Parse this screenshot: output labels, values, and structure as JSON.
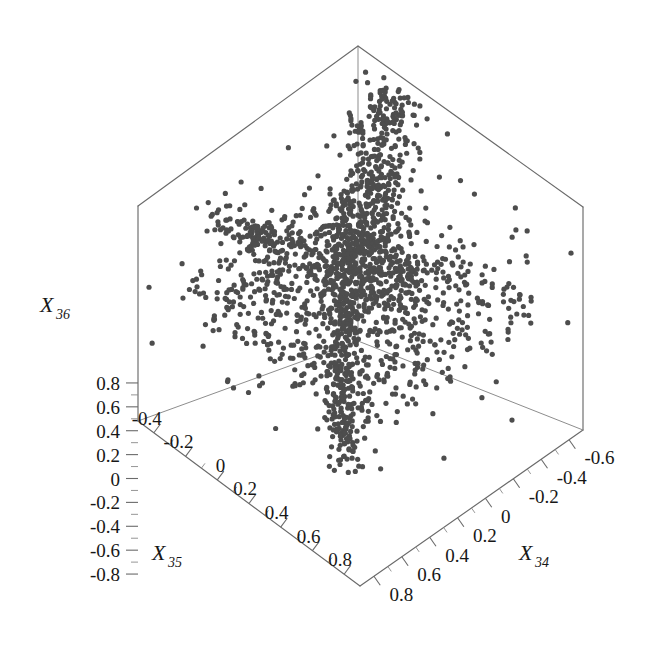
{
  "chart_data": {
    "type": "scatter",
    "projection": "3d",
    "title": "",
    "xlabel": "X_34",
    "ylabel": "X_35",
    "zlabel": "X_36",
    "axes": {
      "x34": {
        "label": "X34",
        "label_base": "X",
        "label_sub": "34",
        "ticks": [
          "-0.6",
          "-0.4",
          "-0.2",
          "0",
          "0.2",
          "0.4",
          "0.6",
          "0.8"
        ],
        "tick_values": [
          -0.6,
          -0.4,
          -0.2,
          0,
          0.2,
          0.4,
          0.6,
          0.8
        ],
        "range": [
          -0.7,
          0.9
        ],
        "minor_ticks_per_interval": 1,
        "direction": "bottom-left to upper-right, values decreasing"
      },
      "x35": {
        "label": "X35",
        "label_base": "X",
        "label_sub": "35",
        "ticks": [
          "-0.4",
          "-0.2",
          "0",
          "0.2",
          "0.4",
          "0.6",
          "0.8"
        ],
        "tick_values": [
          -0.4,
          -0.2,
          0,
          0.2,
          0.4,
          0.6,
          0.8
        ],
        "range": [
          -0.5,
          0.9
        ],
        "minor_ticks_per_interval": 1,
        "direction": "upper-left to bottom-right, values increasing"
      },
      "x36": {
        "label": "X36",
        "label_base": "X",
        "label_sub": "36",
        "ticks": [
          "0.8",
          "0.6",
          "0.4",
          "0.2",
          "0",
          "-0.2",
          "-0.4",
          "-0.6",
          "-0.8"
        ],
        "tick_values": [
          0.8,
          0.6,
          0.4,
          0.2,
          0,
          -0.2,
          -0.4,
          -0.6,
          -0.8
        ],
        "range": [
          -0.9,
          0.9
        ],
        "minor_ticks_per_interval": 1,
        "direction": "vertical, values decreasing downward"
      }
    },
    "grid": false,
    "legend": null,
    "point_color": "#4d4d4d",
    "point_marker": "dot",
    "point_size": 2.6,
    "n_points_approx": 1850,
    "box_frame_color": "#6a6a6a",
    "background": "#ffffff"
  },
  "frame": {
    "top_apex": [
      358,
      46
    ],
    "left_corner_top": [
      138,
      206
    ],
    "right_corner_top": [
      583,
      207
    ],
    "left_corner_bottom": [
      138,
      421
    ],
    "right_corner_bottom": [
      583,
      430
    ],
    "bottom_apex": [
      360,
      586
    ],
    "mid_left": [
      138,
      206
    ],
    "centre_back": [
      358,
      341
    ]
  }
}
